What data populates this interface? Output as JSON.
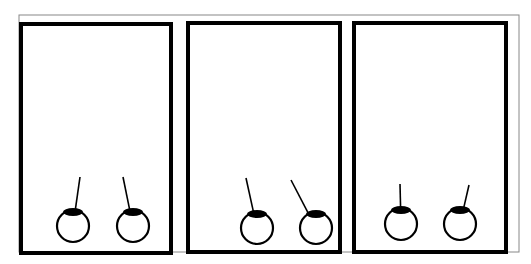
{
  "figure": {
    "width": 531,
    "height": 264,
    "background": "#ffffff",
    "stroke_color": "#000000",
    "outer_frame_color": "#888888",
    "outer_frame": {
      "x": 19,
      "y": 15,
      "w": 500,
      "h": 237
    },
    "panels": [
      {
        "id": "panel-1",
        "rect": {
          "x": 21,
          "y": 24,
          "w": 150,
          "h": 229
        },
        "pendulums": [
          {
            "cx": 73,
            "cy": 226,
            "r": 16,
            "pivot": {
              "x": 80,
              "y": 177
            }
          },
          {
            "cx": 133,
            "cy": 226,
            "r": 16,
            "pivot": {
              "x": 123,
              "y": 177
            }
          }
        ]
      },
      {
        "id": "panel-2",
        "rect": {
          "x": 188,
          "y": 23,
          "w": 152,
          "h": 229
        },
        "pendulums": [
          {
            "cx": 257,
            "cy": 228,
            "r": 16,
            "pivot": {
              "x": 246,
              "y": 178
            }
          },
          {
            "cx": 316,
            "cy": 228,
            "r": 16,
            "pivot": {
              "x": 291,
              "y": 180
            }
          }
        ]
      },
      {
        "id": "panel-3",
        "rect": {
          "x": 354,
          "y": 23,
          "w": 152,
          "h": 229
        },
        "pendulums": [
          {
            "cx": 401,
            "cy": 224,
            "r": 16,
            "pivot": {
              "x": 400,
              "y": 184
            }
          },
          {
            "cx": 460,
            "cy": 224,
            "r": 16,
            "pivot": {
              "x": 469,
              "y": 185
            }
          }
        ]
      }
    ]
  }
}
